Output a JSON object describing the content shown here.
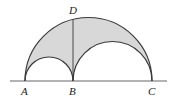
{
  "diagram": {
    "type": "arbelos",
    "points": {
      "A": {
        "label": "A",
        "x": 25,
        "y": 81
      },
      "B": {
        "label": "B",
        "x": 73,
        "y": 81
      },
      "C": {
        "label": "C",
        "x": 152,
        "y": 81
      },
      "D": {
        "label": "D",
        "x": 73,
        "y": 19.4
      }
    },
    "baseline": {
      "x1": 10,
      "x2": 167,
      "y": 81
    },
    "colors": {
      "fill": "#d8d8d8",
      "stroke": "#3a3a3a"
    }
  }
}
